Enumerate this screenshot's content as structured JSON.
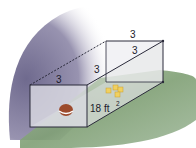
{
  "diagram": {
    "labels": {
      "front_top_edge": "3",
      "side_top_edge": "3",
      "back_top_edge": "3",
      "diagonal": "3",
      "area": "18 ft",
      "area_exponent": "2"
    },
    "colors": {
      "wall_shadow": "#8e8aa6",
      "grass": "#7f9f74",
      "box_face": "#e6e6ec",
      "edge": "#2a2a3a",
      "ball": "#9c4a2c",
      "blocks": "#f0d060"
    }
  }
}
